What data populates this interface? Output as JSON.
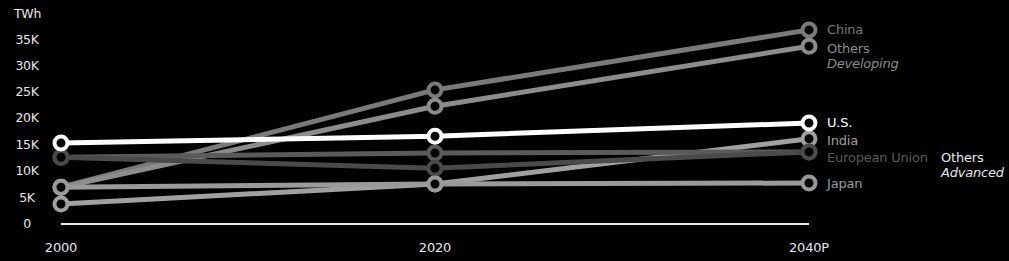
{
  "chart_data": {
    "type": "line",
    "title": "",
    "ylabel": "TWh",
    "xlabel": "",
    "x": [
      "2000",
      "2020",
      "2040P"
    ],
    "y_ticks": [
      "0",
      "5K",
      "10K",
      "15K",
      "20K",
      "25K",
      "30K",
      "35K"
    ],
    "ylim": [
      0,
      37000
    ],
    "grid": false,
    "legend_position": "direct labels at right end of lines",
    "series": [
      {
        "name": "China",
        "values": [
          7000,
          25500,
          36900
        ],
        "color": "#7a7a7a"
      },
      {
        "name": "Others Developing",
        "values": [
          7000,
          22400,
          33800
        ],
        "color": "#8c8c8c"
      },
      {
        "name": "U.S.",
        "values": [
          15400,
          16700,
          19200
        ],
        "color": "#ffffff"
      },
      {
        "name": "India",
        "values": [
          3800,
          7600,
          16200
        ],
        "color": "#a0a0a0"
      },
      {
        "name": "European Union",
        "values": [
          12700,
          13500,
          13700
        ],
        "color": "#5a5a5a"
      },
      {
        "name": "Others Advanced",
        "values": [
          12700,
          10600,
          13700
        ],
        "color": "#4a4a4a"
      },
      {
        "name": "Japan",
        "values": [
          7000,
          7600,
          7800
        ],
        "color": "#9a9a9a"
      }
    ]
  },
  "axis": {
    "y_title": "TWh",
    "y_labels": [
      "35K",
      "30K",
      "25K",
      "20K",
      "15K",
      "10K",
      "5K",
      "0"
    ],
    "x_labels": [
      "2000",
      "2020",
      "2040P"
    ]
  },
  "labels": {
    "china": "China",
    "others_dev_1": "Others",
    "others_dev_2": "Developing",
    "us": "U.S.",
    "india": "India",
    "eu": "European Union",
    "others_adv_1": "Others",
    "others_adv_2": "Advanced",
    "japan": "Japan"
  }
}
